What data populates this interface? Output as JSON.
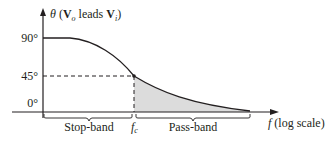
{
  "diagram": {
    "y_axis": {
      "symbol": "θ",
      "open_paren": " (",
      "vo": "V",
      "vo_sub": "o",
      "leads": " leads ",
      "vi": "V",
      "vi_sub": "i",
      "close_paren": ")"
    },
    "y_ticks": [
      "90°",
      "45°",
      "0°"
    ],
    "x_axis": {
      "symbol": "f",
      "suffix": " (log scale)"
    },
    "cutoff": {
      "symbol": "f",
      "sub": "c"
    },
    "bands": {
      "stop": "Stop-band",
      "pass": "Pass-band"
    },
    "colors": {
      "line": "#231f20",
      "shade": "#dcdcdc"
    }
  }
}
